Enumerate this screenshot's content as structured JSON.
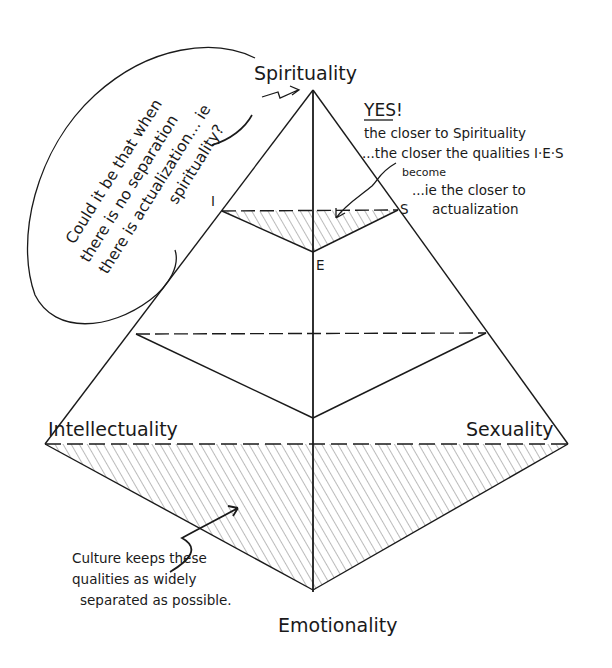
{
  "diagram": {
    "type": "pyramid",
    "vertices": {
      "apex": "Spirituality",
      "left": "Intellectuality",
      "right": "Sexuality",
      "bottom": "Emotionality"
    },
    "inner_triangle_labels": {
      "left": "I",
      "right": "S",
      "bottom": "E"
    },
    "bubble": {
      "lines": [
        "Could it be that when",
        "there is no separation",
        "there is actualization... ie",
        "spirituality?"
      ]
    },
    "note_top_right": {
      "heading": "YES!",
      "lines": [
        "the closer to Spirituality",
        "...the closer the qualities I·E·S",
        "become",
        "...ie the closer to",
        "actualization"
      ]
    },
    "note_bottom_left": {
      "lines": [
        "Culture keeps these",
        "qualities as widely",
        "separated as possible."
      ]
    },
    "colors": {
      "ink": "#1a1a1a",
      "pencil_shading": "#9a9a9a",
      "background": "#ffffff"
    }
  }
}
